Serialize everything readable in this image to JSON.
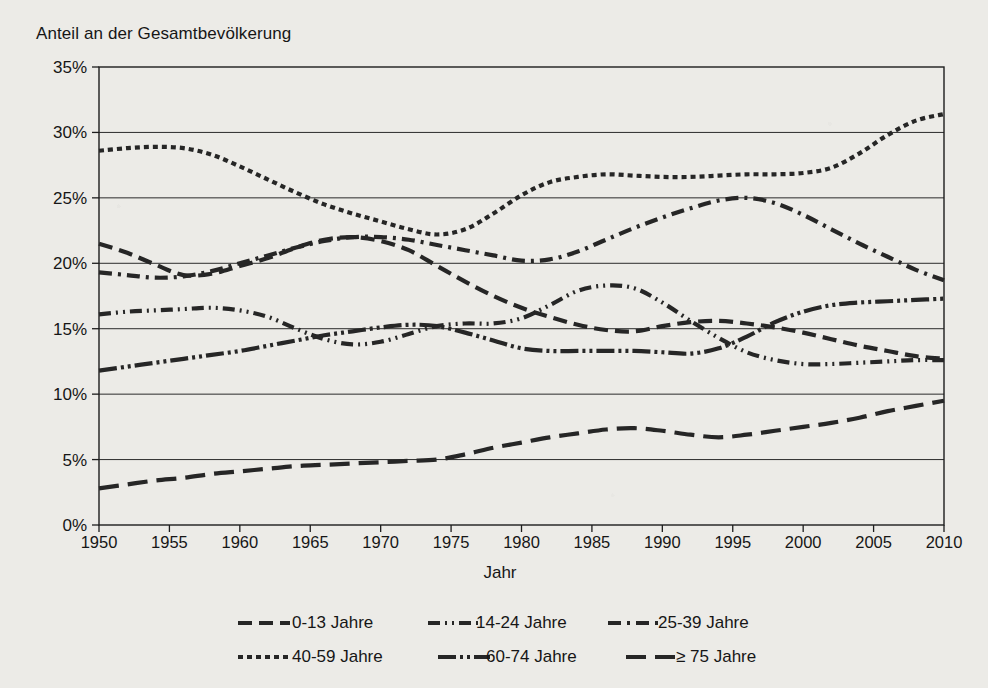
{
  "figure": {
    "ylabel": "Anteil an der Gesamtbevölkerung",
    "xlabel": "Jahr"
  },
  "chart_data": {
    "type": "line",
    "title": "Anteil an der Gesamtbevölkerung",
    "xlabel": "Jahr",
    "ylabel": "Anteil an der Gesamtbevölkerung",
    "xlim": [
      1950,
      2010
    ],
    "ylim": [
      0,
      35
    ],
    "grid": true,
    "legend_position": "bottom",
    "xticks": [
      1950,
      1955,
      1960,
      1965,
      1970,
      1975,
      1980,
      1985,
      1990,
      1995,
      2000,
      2005,
      2010
    ],
    "xtick_labels": [
      "1950",
      "1955",
      "1960",
      "1965",
      "1970",
      "1975",
      "1980",
      "1985",
      "1990",
      "1995",
      "2000",
      "2005",
      "2010"
    ],
    "yticks": [
      0,
      5,
      10,
      15,
      20,
      25,
      30,
      35
    ],
    "ytick_labels": [
      "0%",
      "5%",
      "10%",
      "15%",
      "20%",
      "25%",
      "30%",
      "35%"
    ],
    "x": [
      1950,
      1952,
      1954,
      1956,
      1958,
      1960,
      1962,
      1964,
      1966,
      1968,
      1970,
      1972,
      1974,
      1976,
      1978,
      1980,
      1982,
      1984,
      1986,
      1988,
      1990,
      1992,
      1994,
      1996,
      1998,
      2000,
      2002,
      2004,
      2006,
      2008,
      2010
    ],
    "series": [
      {
        "name": "0-13 Jahre",
        "dash": "14,7",
        "values": [
          21.5,
          20.8,
          19.9,
          19.1,
          19.2,
          19.8,
          20.4,
          21.2,
          21.8,
          22.0,
          21.7,
          21.0,
          19.8,
          18.6,
          17.5,
          16.6,
          15.9,
          15.3,
          14.9,
          14.8,
          15.2,
          15.5,
          15.6,
          15.4,
          15.1,
          14.7,
          14.2,
          13.7,
          13.3,
          12.9,
          12.7
        ]
      },
      {
        "name": "14-24 Jahre",
        "dash": "12,5,2,5,2,5",
        "values": [
          16.1,
          16.3,
          16.4,
          16.5,
          16.6,
          16.4,
          15.9,
          15.0,
          14.2,
          13.8,
          14.0,
          14.6,
          15.2,
          15.4,
          15.4,
          15.8,
          16.8,
          17.9,
          18.3,
          18.1,
          17.0,
          15.6,
          14.3,
          13.2,
          12.6,
          12.3,
          12.3,
          12.4,
          12.5,
          12.6,
          12.6
        ]
      },
      {
        "name": "25-39 Jahre",
        "dash": "13,6,3,6",
        "values": [
          19.3,
          19.1,
          18.9,
          19.0,
          19.4,
          20.0,
          20.6,
          21.2,
          21.7,
          22.0,
          22.0,
          21.8,
          21.4,
          21.0,
          20.6,
          20.2,
          20.3,
          20.9,
          21.8,
          22.7,
          23.5,
          24.2,
          24.8,
          25.0,
          24.6,
          23.7,
          22.6,
          21.5,
          20.5,
          19.5,
          18.7
        ]
      },
      {
        "name": "40-59 Jahre",
        "dash": "5,4",
        "values": [
          28.6,
          28.8,
          28.9,
          28.8,
          28.3,
          27.4,
          26.4,
          25.4,
          24.5,
          23.8,
          23.2,
          22.6,
          22.2,
          22.6,
          23.8,
          25.2,
          26.2,
          26.6,
          26.8,
          26.7,
          26.6,
          26.6,
          26.7,
          26.8,
          26.8,
          26.9,
          27.3,
          28.4,
          29.8,
          30.9,
          31.4
        ]
      },
      {
        "name": "60-74 Jahre",
        "dash": "18,4,3,4,3,4",
        "values": [
          11.8,
          12.1,
          12.4,
          12.7,
          13.0,
          13.3,
          13.7,
          14.1,
          14.5,
          14.8,
          15.1,
          15.3,
          15.2,
          14.7,
          14.1,
          13.5,
          13.3,
          13.3,
          13.3,
          13.3,
          13.2,
          13.1,
          13.5,
          14.4,
          15.5,
          16.3,
          16.8,
          17.0,
          17.1,
          17.2,
          17.3
        ]
      },
      {
        "name": "≥ 75 Jahre",
        "dash": "20,9",
        "values": [
          2.8,
          3.1,
          3.4,
          3.6,
          3.9,
          4.1,
          4.3,
          4.5,
          4.6,
          4.7,
          4.8,
          4.9,
          5.0,
          5.4,
          5.9,
          6.3,
          6.7,
          7.0,
          7.3,
          7.4,
          7.2,
          6.9,
          6.7,
          6.9,
          7.2,
          7.5,
          7.8,
          8.2,
          8.7,
          9.1,
          9.5
        ]
      }
    ]
  },
  "legend": {
    "items": [
      {
        "label": "0-13 Jahre",
        "dash": "14,7"
      },
      {
        "label": "14-24 Jahre",
        "dash": "12,5,2,5,2,5"
      },
      {
        "label": "25-39 Jahre",
        "dash": "13,6,3,6"
      },
      {
        "label": "40-59 Jahre",
        "dash": "5,4"
      },
      {
        "label": "60-74 Jahre",
        "dash": "18,4,3,4,3,4"
      },
      {
        "label": "≥ 75 Jahre",
        "dash": "20,9"
      }
    ]
  }
}
